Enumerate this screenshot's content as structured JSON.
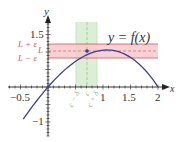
{
  "figure": {
    "curve_label": "y = f(x)",
    "x_axis_label": "x",
    "y_axis_label": "y",
    "x_ticks": [
      {
        "value": -0.5,
        "label": "−0.5"
      },
      {
        "value": 1,
        "label": "1"
      },
      {
        "value": 1.5,
        "label": "1.5"
      },
      {
        "value": 2,
        "label": "2"
      }
    ],
    "y_ticks": [
      {
        "value": 1.5,
        "label": "1.5"
      },
      {
        "value": -1,
        "label": "−1"
      }
    ],
    "epsilon_band": {
      "upper_label": "L + ε",
      "center_label": "L",
      "lower_label": "L − ε",
      "L": 1.03,
      "epsilon": 0.2,
      "color_fill": "#f6c9cc",
      "color_line": "#e0505a"
    },
    "delta_band": {
      "left_label": "c − δ",
      "center_label": "c",
      "right_label": "c + δ",
      "c": 0.71,
      "delta": 0.19,
      "color_fill": "#dcefd6",
      "color_line": "#9ccf8f",
      "label_color": "#8fbf7f"
    },
    "colors": {
      "curve": "#3b3d8f",
      "axis": "#222222",
      "label_red": "#d9535c",
      "point": "#3b3d8f"
    },
    "function": {
      "description": "cubic x(2-x)(0.9+0.152x)",
      "x_range": [
        -0.45,
        2.0
      ]
    }
  }
}
